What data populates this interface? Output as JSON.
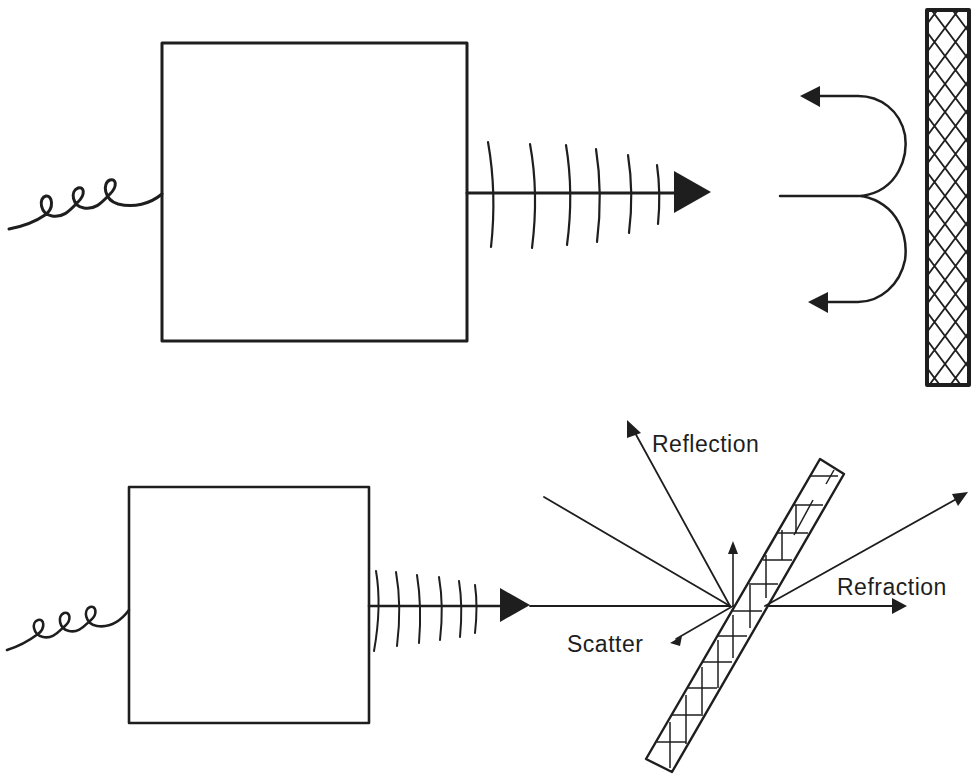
{
  "colors": {
    "ink": "#1e1e1e",
    "background": "#ffffff"
  },
  "top_figure": {
    "title": "Reflection from a surface",
    "source_box": {
      "x": 162,
      "y": 43,
      "w": 305,
      "h": 298
    },
    "input_coil": {
      "icon": "coil-wire-icon",
      "loops": 3
    },
    "emitted_beam": {
      "icon": "wavefront-arrow-icon",
      "wavefront_count": 6
    },
    "reflected_arrows": {
      "icon": "reflection-return-arrows-icon",
      "count": 2
    },
    "reflector": {
      "icon": "crosshatched-plate-icon",
      "x": 927,
      "y": 10,
      "w": 42,
      "h": 375
    }
  },
  "bottom_figure": {
    "title": "Interaction with an inclined plate",
    "source_box": {
      "x": 129,
      "y": 487,
      "w": 240,
      "h": 236
    },
    "input_coil": {
      "icon": "coil-wire-icon",
      "loops": 3
    },
    "emitted_beam": {
      "icon": "wavefront-arrow-icon",
      "wavefront_count": 6
    },
    "plate": {
      "icon": "crosshatched-inclined-plate-icon"
    },
    "labels": {
      "reflection": "Reflection",
      "refraction": "Refraction",
      "scatter": "Scatter"
    }
  }
}
